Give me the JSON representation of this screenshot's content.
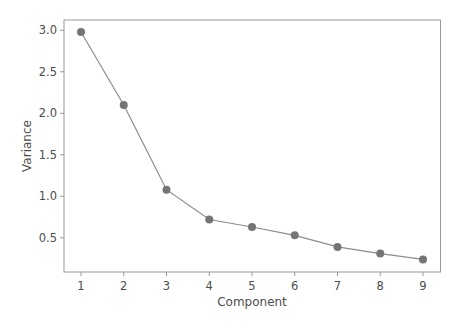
{
  "chart_data": {
    "type": "line",
    "title": "",
    "xlabel": "Component",
    "ylabel": "Variance",
    "x": [
      1,
      2,
      3,
      4,
      5,
      6,
      7,
      8,
      9
    ],
    "series": [
      {
        "name": "Variance",
        "values": [
          2.98,
          2.1,
          1.08,
          0.72,
          0.63,
          0.53,
          0.39,
          0.31,
          0.24
        ]
      }
    ],
    "xticks": [
      "1",
      "2",
      "3",
      "4",
      "5",
      "6",
      "7",
      "8",
      "9"
    ],
    "yticks": [
      0.5,
      1.0,
      1.5,
      2.0,
      2.5,
      3.0
    ],
    "ytick_labels": [
      "0.5",
      "1.0",
      "1.5",
      "2.0",
      "2.5",
      "3.0"
    ],
    "xlim": [
      0.6,
      9.4
    ],
    "ylim": [
      0.11,
      3.13
    ],
    "grid": false,
    "legend": null,
    "colors": {
      "line": "#8c8c8c",
      "marker": "#757575",
      "axes": "#999999",
      "text": "#4d4d4d"
    }
  }
}
